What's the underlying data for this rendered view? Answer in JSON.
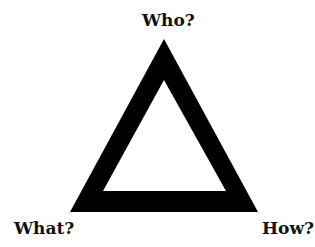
{
  "diagram": {
    "shape": "triangle",
    "labels": {
      "top": "Who?",
      "bottom_left": "What?",
      "bottom_right": "How?"
    },
    "colors": {
      "stroke": "#000000",
      "background": "#ffffff"
    }
  }
}
